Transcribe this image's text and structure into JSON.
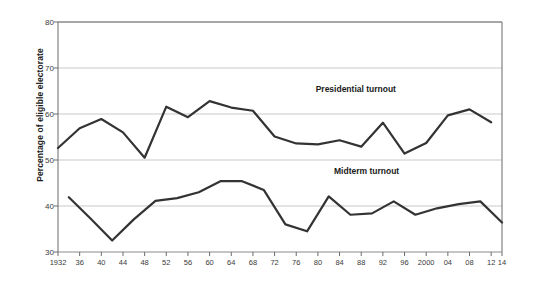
{
  "chart_data": {
    "type": "line",
    "title": "",
    "xlabel": "",
    "ylabel": "Percentage of eligible electorate",
    "ylim": [
      30,
      80
    ],
    "yticks": [
      30,
      40,
      50,
      60,
      70,
      80
    ],
    "xlim": [
      1932,
      2014
    ],
    "xticks": [
      1932,
      1936,
      1940,
      1944,
      1948,
      1952,
      1956,
      1960,
      1964,
      1968,
      1972,
      1976,
      1980,
      1984,
      1988,
      1992,
      1996,
      2000,
      2004,
      2008,
      2012,
      2014
    ],
    "xticklabels": [
      "1932",
      "36",
      "40",
      "44",
      "48",
      "52",
      "56",
      "60",
      "64",
      "68",
      "72",
      "76",
      "80",
      "84",
      "88",
      "92",
      "96",
      "2000",
      "04",
      "08",
      "12",
      "14"
    ],
    "grid": true,
    "legend_position": "inline-annotations",
    "line_color": "#333333",
    "grid_color": "#c9c9c9",
    "axis_color": "#666666",
    "series": [
      {
        "name": "Presidential turnout",
        "label_x": 1987,
        "label_y": 65.5,
        "x": [
          1932,
          1936,
          1940,
          1944,
          1948,
          1952,
          1956,
          1960,
          1964,
          1968,
          1972,
          1976,
          1980,
          1984,
          1988,
          1992,
          1996,
          2000,
          2004,
          2008,
          2012
        ],
        "values": [
          52.6,
          56.9,
          58.9,
          56.0,
          50.5,
          61.6,
          59.3,
          62.8,
          61.4,
          60.7,
          55.1,
          53.6,
          53.4,
          54.3,
          52.9,
          58.1,
          51.4,
          53.7,
          59.7,
          61.0,
          58.2
        ]
      },
      {
        "name": "Midterm turnout",
        "label_x": 1989,
        "label_y": 47.6,
        "x": [
          1934,
          1938,
          1942,
          1946,
          1950,
          1954,
          1958,
          1962,
          1966,
          1970,
          1974,
          1978,
          1982,
          1986,
          1990,
          1994,
          1998,
          2002,
          2006,
          2010,
          2014
        ],
        "values": [
          41.9,
          37.3,
          32.5,
          37.1,
          41.1,
          41.7,
          43.0,
          45.4,
          45.4,
          43.5,
          36.0,
          34.5,
          42.1,
          38.1,
          38.4,
          41.0,
          38.1,
          39.5,
          40.4,
          41.0,
          36.4
        ]
      }
    ]
  }
}
